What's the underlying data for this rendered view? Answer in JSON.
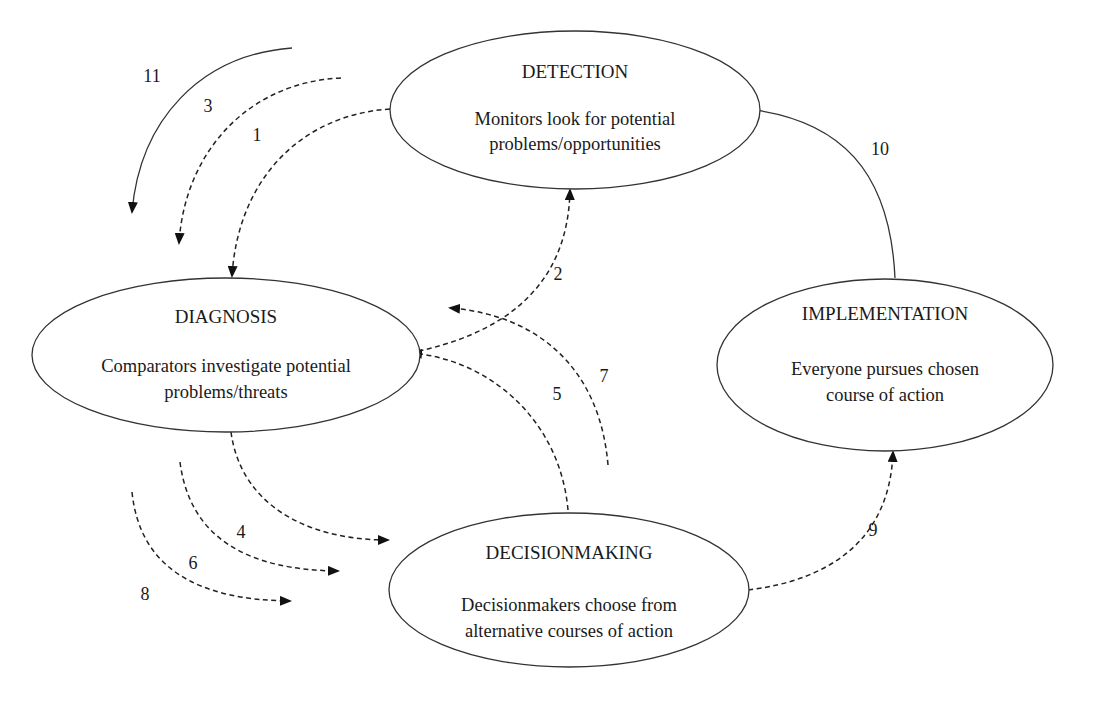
{
  "diagram": {
    "type": "process-cycle",
    "nodes": {
      "detection": {
        "title": "DETECTION",
        "desc_line1": "Monitors look for potential",
        "desc_line2": "problems/opportunities"
      },
      "diagnosis": {
        "title": "DIAGNOSIS",
        "desc_line1": "Comparators investigate potential",
        "desc_line2": "problems/threats"
      },
      "implementation": {
        "title": "IMPLEMENTATION",
        "desc_line1": "Everyone pursues chosen",
        "desc_line2": "course of action"
      },
      "decisionmaking": {
        "title": "DECISIONMAKING",
        "desc_line1": "Decisionmakers choose from",
        "desc_line2": "alternative courses of action"
      }
    },
    "arrows": {
      "a1": {
        "label": "1",
        "from": "DETECTION",
        "to": "DIAGNOSIS",
        "style": "dashed"
      },
      "a2": {
        "label": "2",
        "from": "DIAGNOSIS",
        "to": "DETECTION",
        "style": "dashed"
      },
      "a3": {
        "label": "3",
        "from": "DETECTION",
        "to": "DIAGNOSIS",
        "style": "dashed"
      },
      "a4": {
        "label": "4",
        "from": "DIAGNOSIS",
        "to": "DECISIONMAKING",
        "style": "dashed"
      },
      "a5": {
        "label": "5",
        "from": "DECISIONMAKING",
        "to": "DIAGNOSIS",
        "style": "dashed"
      },
      "a6": {
        "label": "6",
        "from": "DIAGNOSIS",
        "to": "DECISIONMAKING",
        "style": "dashed"
      },
      "a7": {
        "label": "7",
        "from": "DECISIONMAKING",
        "to": "DIAGNOSIS",
        "style": "dashed"
      },
      "a8": {
        "label": "8",
        "from": "DIAGNOSIS",
        "to": "DECISIONMAKING",
        "style": "dashed"
      },
      "a9": {
        "label": "9",
        "from": "DECISIONMAKING",
        "to": "IMPLEMENTATION",
        "style": "dashed"
      },
      "a10": {
        "label": "10",
        "from": "IMPLEMENTATION",
        "to": "DETECTION",
        "style": "solid"
      },
      "a11": {
        "label": "11",
        "from": "DETECTION",
        "to": "DIAGNOSIS",
        "style": "solid"
      }
    }
  }
}
